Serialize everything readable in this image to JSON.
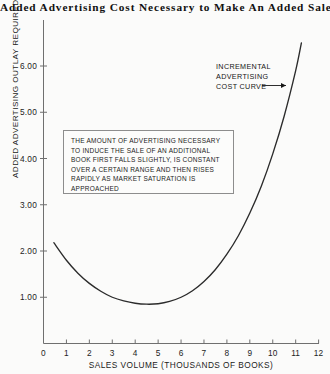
{
  "chart_data": {
    "type": "line",
    "title": "Added Advertising Cost Necessary to Make An Added Sale",
    "xlabel": "SALES VOLUME (THOUSANDS OF BOOKS)",
    "ylabel": "ADDED ADVERTISING OUTLAY REQUIRED (DOLLARS PER BOOK)",
    "xlim": [
      0,
      12
    ],
    "ylim": [
      0,
      6.9
    ],
    "grid": false,
    "legend": "none",
    "xticks": [
      "0",
      "1",
      "2",
      "3",
      "4",
      "5",
      "6",
      "7",
      "8",
      "9",
      "10",
      "11",
      "12"
    ],
    "xtick_values": [
      0,
      1,
      2,
      3,
      4,
      5,
      6,
      7,
      8,
      9,
      10,
      11,
      12
    ],
    "yticks": [
      "1.00",
      "2.00",
      "3.00",
      "4.00",
      "5.00",
      "6.00"
    ],
    "ytick_values": [
      1,
      2,
      3,
      4,
      5,
      6
    ],
    "series": [
      {
        "name": "INCREMENTAL ADVERTISING COST CURVE",
        "x": [
          0.45,
          1.0,
          1.5,
          2.0,
          2.5,
          3.0,
          3.5,
          4.0,
          4.5,
          5.0,
          5.5,
          6.0,
          6.5,
          7.0,
          7.5,
          8.0,
          8.5,
          9.0,
          9.5,
          10.0,
          10.5,
          11.0,
          11.25
        ],
        "y": [
          2.18,
          1.8,
          1.52,
          1.3,
          1.13,
          1.0,
          0.92,
          0.87,
          0.85,
          0.86,
          0.91,
          1.0,
          1.14,
          1.34,
          1.6,
          1.93,
          2.33,
          2.82,
          3.4,
          4.1,
          4.92,
          5.9,
          6.5
        ]
      }
    ],
    "annotations": [
      {
        "name": "curve-label",
        "text_lines": [
          "INCREMENTAL",
          "ADVERTISING",
          "COST CURVE"
        ],
        "has_arrow": true,
        "arrow_points_to": [
          11.0,
          5.9
        ]
      },
      {
        "name": "explanatory-note",
        "text": "THE AMOUNT OF ADVERTISING NECESSARY TO INDUCE THE SALE OF AN ADDITIONAL BOOK FIRST FALLS SLIGHTLY, IS CONSTANT OVER A CERTAIN RANGE AND THEN RISES RAPIDLY AS MARKET SATURATION IS APPROACHED"
      }
    ],
    "colors": {
      "curve": "#2b2b2b",
      "axis": "#6f6f6f",
      "background": "#fbfbfa",
      "annotation_border": "#8d8d8d"
    }
  }
}
